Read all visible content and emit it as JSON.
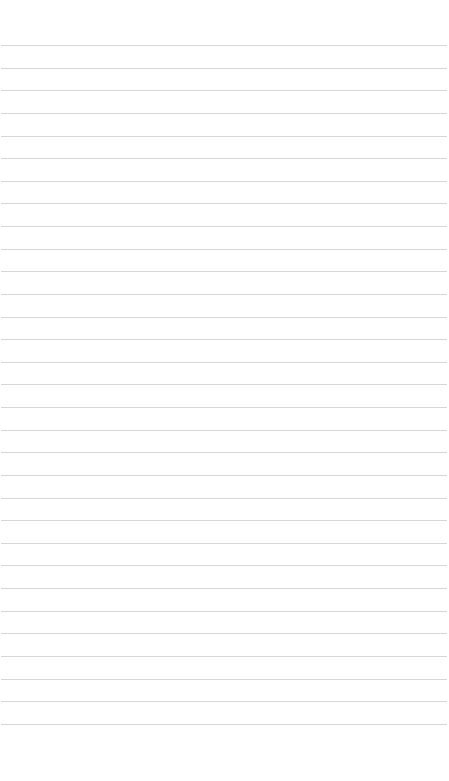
{
  "page": {
    "type": "ruled-paper",
    "background_color": "#ffffff",
    "line_color": "#d6d6d6",
    "line_count": 31,
    "first_line_y": 45,
    "line_spacing": 22.63
  }
}
